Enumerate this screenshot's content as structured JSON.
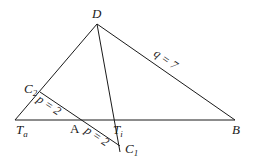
{
  "diagram": {
    "points": {
      "D": {
        "label": "D",
        "x": 97,
        "y": 24
      },
      "Ta": {
        "label": "T",
        "sub": "a",
        "x": 15,
        "y": 120
      },
      "A": {
        "label": "A",
        "x": 79,
        "y": 120
      },
      "Ti": {
        "label": "T",
        "sub": "i",
        "x": 114,
        "y": 120
      },
      "B": {
        "label": "B",
        "x": 235,
        "y": 120
      },
      "C2": {
        "label": "C",
        "sub": "2",
        "x": 40,
        "y": 92
      },
      "C1": {
        "label": "C",
        "sub": "1",
        "x": 120,
        "y": 146
      }
    },
    "segment_labels": {
      "q": "q = 7",
      "p_upper": "p = 2",
      "p_lower": "p = 2"
    }
  }
}
